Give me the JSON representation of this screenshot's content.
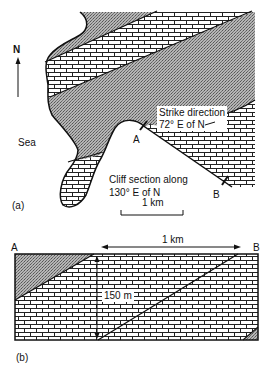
{
  "map": {
    "north_label": "N",
    "sea_label": "Sea",
    "strike_label_line1": "Strike direction",
    "strike_label_line2": "72° E of N",
    "cliff_label_line1": "Cliff section along",
    "cliff_label_line2": "130° E of N",
    "point_a": "A",
    "point_b": "B",
    "scale_label": "1 km",
    "panel_label": "(a)"
  },
  "section": {
    "point_a": "A",
    "point_b": "B",
    "length_label": "1 km",
    "thickness_label": "150 m",
    "panel_label": "(b)"
  },
  "legend_colors": {
    "stipple_fill": "#9a9a9a",
    "brick_line": "#222222",
    "outline": "#111111"
  }
}
